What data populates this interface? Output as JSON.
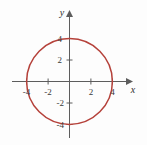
{
  "figure": {
    "width": 147,
    "height": 145,
    "background_color": "#fdfdfd",
    "axis_color": "#5d5d5d",
    "label_color": "#3a3a3a"
  },
  "chart_data": {
    "type": "line",
    "title": "",
    "subtitle": "",
    "xlabel": "x",
    "ylabel": "y",
    "grid": false,
    "legend": null,
    "xlim": [
      -5.0,
      5.5
    ],
    "ylim": [
      -5.2,
      5.3
    ],
    "xticks": [
      -4,
      -2,
      2,
      4
    ],
    "yticks": [
      -4,
      -2,
      2,
      4
    ],
    "xtick_labels": [
      "-4",
      "-2",
      "2",
      "4"
    ],
    "ytick_labels": [
      "-4",
      "-2",
      "2",
      "4"
    ],
    "series": [
      {
        "name": "circle",
        "kind": "circle",
        "equation": "x^2 + y^2 = 16",
        "center": [
          0,
          0
        ],
        "radius": 4,
        "color": "#b5413a",
        "linewidth": 1.5,
        "points": [
          [
            4.0,
            0.0
          ],
          [
            3.86,
            1.06
          ],
          [
            3.46,
            2.0
          ],
          [
            2.83,
            2.83
          ],
          [
            2.0,
            3.46
          ],
          [
            1.06,
            3.86
          ],
          [
            0.0,
            4.0
          ],
          [
            -1.06,
            3.86
          ],
          [
            -2.0,
            3.46
          ],
          [
            -2.83,
            2.83
          ],
          [
            -3.46,
            2.0
          ],
          [
            -3.86,
            1.06
          ],
          [
            -4.0,
            0.0
          ],
          [
            -3.86,
            -1.06
          ],
          [
            -3.46,
            -2.0
          ],
          [
            -2.83,
            -2.83
          ],
          [
            -2.0,
            -3.46
          ],
          [
            -1.06,
            -3.86
          ],
          [
            0.0,
            -4.0
          ],
          [
            1.06,
            -3.86
          ],
          [
            2.0,
            -3.46
          ],
          [
            2.83,
            -2.83
          ],
          [
            3.46,
            -2.0
          ],
          [
            3.86,
            -1.06
          ],
          [
            4.0,
            0.0
          ]
        ]
      }
    ],
    "axis_arrows": {
      "x_positive": true,
      "y_positive": true
    }
  },
  "labels": {
    "x_axis_name": "x",
    "y_axis_name": "y",
    "x_neg4": "-4",
    "x_neg2": "-2",
    "x_pos2": "2",
    "x_pos4": "4",
    "y_neg4": "-4",
    "y_neg2": "-2",
    "y_pos2": "2",
    "y_pos4": "4"
  }
}
